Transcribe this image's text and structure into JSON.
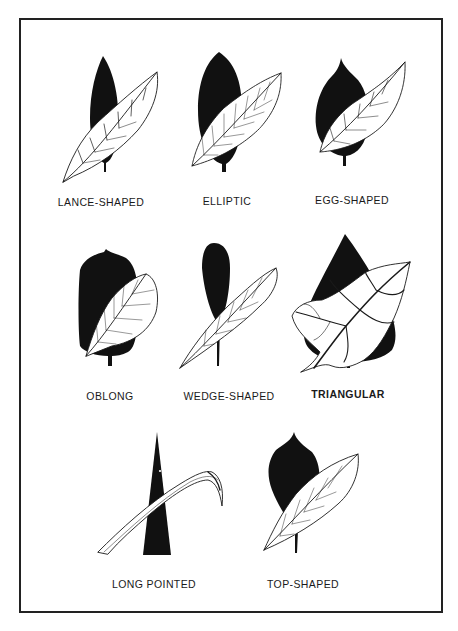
{
  "diagram": {
    "title": "",
    "colors": {
      "silhouette": "#111111",
      "leaf_fill": "#ffffff",
      "leaf_line": "#1a1a1a",
      "frame": "#222222"
    },
    "leaves": [
      {
        "id": "lance-shaped",
        "label": "LANCE-SHAPED",
        "row": 1,
        "col": 1
      },
      {
        "id": "elliptic",
        "label": "ELLIPTIC",
        "row": 1,
        "col": 2
      },
      {
        "id": "egg-shaped",
        "label": "EGG-SHAPED",
        "row": 1,
        "col": 3
      },
      {
        "id": "oblong",
        "label": "OBLONG",
        "row": 2,
        "col": 1
      },
      {
        "id": "wedge-shaped",
        "label": "WEDGE-SHAPED",
        "row": 2,
        "col": 2
      },
      {
        "id": "triangular",
        "label": "TRIANGULAR",
        "row": 2,
        "col": 3
      },
      {
        "id": "long-pointed",
        "label": "LONG POINTED",
        "row": 3,
        "col": 1
      },
      {
        "id": "top-shaped",
        "label": "TOP-SHAPED",
        "row": 3,
        "col": 2
      }
    ]
  }
}
